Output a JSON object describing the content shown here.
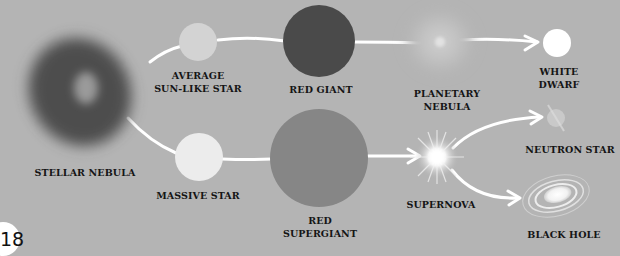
{
  "page": {
    "number": "18",
    "background": "#b4b4b4"
  },
  "diagram": {
    "nodes": [
      {
        "id": "stellar-nebula",
        "label_lines": [
          "STELLAR NEBULA"
        ]
      },
      {
        "id": "average-star",
        "label_lines": [
          "AVERAGE",
          "SUN-LIKE STAR"
        ]
      },
      {
        "id": "red-giant",
        "label_lines": [
          "RED GIANT"
        ]
      },
      {
        "id": "planetary-nebula",
        "label_lines": [
          "PLANETARY",
          "NEBULA"
        ]
      },
      {
        "id": "white-dwarf",
        "label_lines": [
          "WHITE",
          "DWARF"
        ]
      },
      {
        "id": "massive-star",
        "label_lines": [
          "MASSIVE STAR"
        ]
      },
      {
        "id": "red-supergiant",
        "label_lines": [
          "RED",
          "SUPERGIANT"
        ]
      },
      {
        "id": "supernova",
        "label_lines": [
          "SUPERNOVA"
        ]
      },
      {
        "id": "neutron-star",
        "label_lines": [
          "NEUTRON STAR"
        ]
      },
      {
        "id": "black-hole",
        "label_lines": [
          "BLACK HOLE"
        ]
      }
    ],
    "edges": [
      [
        "stellar-nebula",
        "average-star"
      ],
      [
        "average-star",
        "red-giant"
      ],
      [
        "red-giant",
        "planetary-nebula"
      ],
      [
        "planetary-nebula",
        "white-dwarf"
      ],
      [
        "stellar-nebula",
        "massive-star"
      ],
      [
        "massive-star",
        "red-supergiant"
      ],
      [
        "red-supergiant",
        "supernova"
      ],
      [
        "supernova",
        "neutron-star"
      ],
      [
        "supernova",
        "black-hole"
      ]
    ],
    "colors": {
      "path": "#ffffff",
      "nebula": "#4e4e4e",
      "average_star": "#d3d3d3",
      "red_giant": "#4a4a4a",
      "white_dwarf": "#ffffff",
      "massive_star": "#ececec",
      "red_supergiant": "#868686",
      "label": "#151515"
    }
  }
}
